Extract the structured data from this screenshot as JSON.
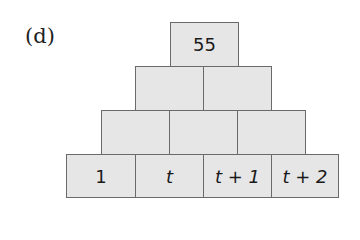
{
  "label": "(d)",
  "pyramid": {
    "rows": [
      [
        "55"
      ],
      [
        "",
        ""
      ],
      [
        "",
        "",
        ""
      ],
      [
        "1",
        "t",
        "t + 1",
        "t + 2"
      ]
    ],
    "colors": {
      "fill": "#e6e6e6",
      "border": "#6a6a6a",
      "text": "#1a1a1a"
    }
  }
}
